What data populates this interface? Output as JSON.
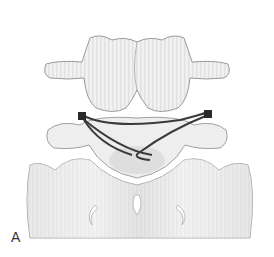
{
  "figure": {
    "label": "A",
    "colors": {
      "bone": "#efefef",
      "bone_shadow": "#c8c8c8",
      "outline": "#9a9a9a",
      "wire": "#3a3a3a",
      "background": "#ffffff"
    }
  }
}
